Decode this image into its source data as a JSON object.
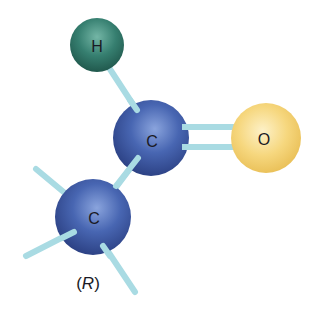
{
  "figure": {
    "colors": {
      "carbon": "#3b5aa6",
      "carbon_highlight": "#7f9bd8",
      "carbon_shadow": "#22346e",
      "hydrogen": "#2f7a6b",
      "hydrogen_highlight": "#6fb3a3",
      "hydrogen_shadow": "#1b4f45",
      "oxygen": "#f3cf6c",
      "oxygen_highlight": "#fdf0c4",
      "oxygen_shadow": "#e3b445",
      "bond": "#a9dbe3"
    },
    "atoms": [
      {
        "id": "h1",
        "symbol": "H",
        "element": "hydrogen",
        "cx": 97,
        "cy": 45,
        "r": 27
      },
      {
        "id": "c1",
        "symbol": "C",
        "element": "carbon",
        "cx": 151,
        "cy": 138,
        "r": 38
      },
      {
        "id": "o1",
        "symbol": "O",
        "element": "oxygen",
        "cx": 266,
        "cy": 138,
        "r": 35
      },
      {
        "id": "c2",
        "symbol": "C",
        "element": "carbon",
        "cx": 93,
        "cy": 217,
        "r": 38
      }
    ],
    "bonds": [
      {
        "from": "h1",
        "to": "c1",
        "order": 1
      },
      {
        "from": "c1",
        "to": "o1",
        "order": 2
      },
      {
        "from": "c1",
        "to": "c2",
        "order": 1
      },
      {
        "from": "c2",
        "to": "stub-upper-left",
        "order": 1
      },
      {
        "from": "c2",
        "to": "stub-left",
        "order": 1
      },
      {
        "from": "c2",
        "to": "stub-lower-right",
        "order": 1
      }
    ],
    "group_label": "(R)",
    "group_label_letter": "R"
  }
}
